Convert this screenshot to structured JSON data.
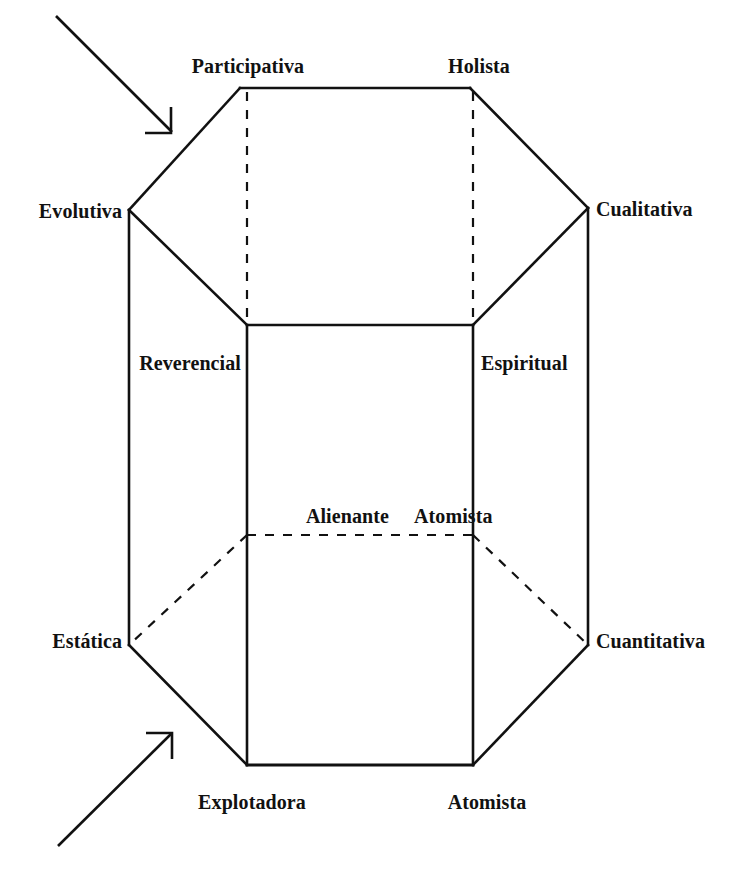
{
  "figure": {
    "type": "hexagonal-prism-diagram",
    "background_color": "#ffffff",
    "stroke_color": "#111111",
    "language": "es"
  },
  "labels": {
    "top_left": "Participativa",
    "top_right": "Holista",
    "upper_left_vertex": "Evolutiva",
    "upper_right_vertex": "Cualitativa",
    "front_upper_left": "Reverencial",
    "front_upper_right": "Espiritual",
    "front_lower_left": "Alienante",
    "front_lower_right": "Atomista",
    "lower_left_vertex": "Estática",
    "lower_right_vertex": "Cuantitativa",
    "bottom_left": "Explotadora",
    "bottom_right": "Atomista"
  },
  "annotations": {
    "arrow_top": "arrow-pointing-down-right",
    "arrow_bottom": "arrow-pointing-up-right"
  },
  "geometry": {
    "top_edge_y": 88,
    "top_edge_x_left": 240,
    "top_edge_x_right": 470,
    "left_vertex": [
      129,
      210
    ],
    "right_vertex": [
      588,
      208
    ],
    "front_top_y": 325,
    "front_left_x": 247,
    "front_right_x": 473,
    "hidden_bottom_y": 535,
    "lower_left_vertex": [
      129,
      645
    ],
    "lower_right_vertex": [
      588,
      645
    ],
    "bottom_edge_y": 765
  }
}
